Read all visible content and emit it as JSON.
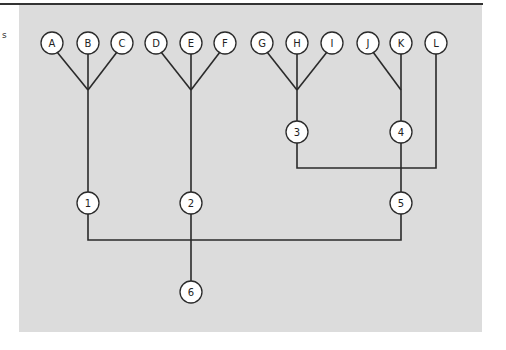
{
  "diagram": {
    "margin_mark": "s",
    "colors": {
      "panel": "#dcdcdc",
      "line": "#2a2a2a",
      "node_fill": "#ffffff"
    },
    "leaf_nodes": [
      {
        "id": "A",
        "label": "A",
        "x": 52,
        "y": 43
      },
      {
        "id": "B",
        "label": "B",
        "x": 88,
        "y": 43
      },
      {
        "id": "C",
        "label": "C",
        "x": 122,
        "y": 43
      },
      {
        "id": "D",
        "label": "D",
        "x": 156,
        "y": 43
      },
      {
        "id": "E",
        "label": "E",
        "x": 191,
        "y": 43
      },
      {
        "id": "F",
        "label": "F",
        "x": 225,
        "y": 43
      },
      {
        "id": "G",
        "label": "G",
        "x": 262,
        "y": 43
      },
      {
        "id": "H",
        "label": "H",
        "x": 297,
        "y": 43
      },
      {
        "id": "I",
        "label": "I",
        "x": 332,
        "y": 43
      },
      {
        "id": "J",
        "label": "J",
        "x": 368,
        "y": 43
      },
      {
        "id": "K",
        "label": "K",
        "x": 401,
        "y": 43
      },
      {
        "id": "L",
        "label": "L",
        "x": 436,
        "y": 43
      }
    ],
    "internal_nodes": [
      {
        "id": "1",
        "label": "1",
        "x": 88,
        "y": 203
      },
      {
        "id": "2",
        "label": "2",
        "x": 191,
        "y": 203
      },
      {
        "id": "3",
        "label": "3",
        "x": 297,
        "y": 132
      },
      {
        "id": "4",
        "label": "4",
        "x": 401,
        "y": 132
      },
      {
        "id": "5",
        "label": "5",
        "x": 401,
        "y": 203
      },
      {
        "id": "6",
        "label": "6",
        "x": 191,
        "y": 292
      }
    ],
    "connections": [
      {
        "from": [
          "A",
          "B",
          "C"
        ],
        "to": "1"
      },
      {
        "from": [
          "D",
          "E",
          "F"
        ],
        "to": "2"
      },
      {
        "from": [
          "G",
          "H",
          "I"
        ],
        "to": "3"
      },
      {
        "from": [
          "J",
          "K"
        ],
        "to": "4"
      },
      {
        "from": [
          "3",
          "4",
          "L"
        ],
        "to": "5"
      },
      {
        "from": [
          "1",
          "2",
          "5"
        ],
        "to": "6"
      }
    ]
  }
}
